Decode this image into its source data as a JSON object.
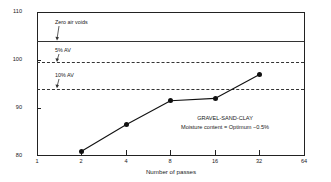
{
  "chart_data": {
    "type": "scatter",
    "title": "",
    "xlabel": "Number of passes",
    "ylabel": "Relative compaction value (per cent)",
    "xscale": "log2",
    "xlim": [
      1,
      64
    ],
    "ylim": [
      80,
      110
    ],
    "grid": false,
    "legend_position": "none",
    "xticks": [
      "1",
      "2",
      "4",
      "8",
      "16",
      "32",
      "64"
    ],
    "xtick_values": [
      1,
      2,
      4,
      8,
      16,
      32,
      64
    ],
    "yticks": [
      "80",
      "90",
      "100",
      "110"
    ],
    "ytick_values": [
      80,
      90,
      100,
      110
    ],
    "series": [
      {
        "name": "GRAVEL-SAND-CLAY",
        "x": [
          2,
          4,
          8,
          16,
          32
        ],
        "values": [
          81,
          86.5,
          91.5,
          92,
          97
        ],
        "marker": "filled-circle",
        "line": "solid"
      }
    ],
    "reference_lines": [
      {
        "label": "Zero air voids",
        "value": 104,
        "style": "solid"
      },
      {
        "label": "5% AV",
        "value": 99.5,
        "style": "dash-dot"
      },
      {
        "label": "10% AV",
        "value": 94,
        "style": "dash-dot"
      }
    ],
    "annotations": [
      {
        "line1": "GRAVEL-SAND-CLAY",
        "line2": "Moisture content = Optimum −0.5%"
      }
    ]
  },
  "annotation": {
    "material": "GRAVEL-SAND-CLAY",
    "moisture": "Moisture content = Optimum −0.5%"
  },
  "axes": {
    "x_title": "Number of passes",
    "y_title": "Relative compaction value (per cent)"
  },
  "reference_labels": {
    "zero_air_voids": "Zero air voids",
    "av5": "5% AV",
    "av10": "10% AV"
  },
  "xticklabels": {
    "t0": "1",
    "t1": "2",
    "t2": "4",
    "t3": "8",
    "t4": "16",
    "t5": "32",
    "t6": "64"
  },
  "yticklabels": {
    "t0": "110",
    "t1": "100",
    "t2": "90",
    "t3": "80"
  },
  "colors": {
    "axis": "#222222",
    "marker": "#111111",
    "reference": "#333333"
  }
}
